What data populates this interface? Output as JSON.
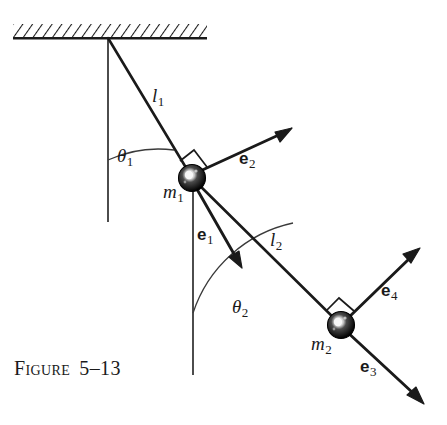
{
  "figure": {
    "caption_word": "Figure",
    "caption_number": "5–13",
    "caption_full": "Figure 5–13",
    "background_color": "#ffffff",
    "ink_color": "#1a1a1a"
  },
  "labels": {
    "l1": {
      "base": "l",
      "sub": "1"
    },
    "l2": {
      "base": "l",
      "sub": "2"
    },
    "m1": {
      "base": "m",
      "sub": "1"
    },
    "m2": {
      "base": "m",
      "sub": "2"
    },
    "theta1": {
      "base": "θ",
      "sub": "1"
    },
    "theta2": {
      "base": "θ",
      "sub": "2"
    },
    "e1": {
      "base": "e",
      "sub": "1"
    },
    "e2": {
      "base": "e",
      "sub": "2"
    },
    "e3": {
      "base": "e",
      "sub": "3"
    },
    "e4": {
      "base": "e",
      "sub": "4"
    }
  },
  "geometry": {
    "pivot": {
      "x": 108,
      "y": 38
    },
    "mass1_center": {
      "x": 192,
      "y": 178
    },
    "mass2_center": {
      "x": 341,
      "y": 325
    },
    "mass_radius": 13,
    "ceiling": {
      "x_left": 13,
      "x_right": 207,
      "y_line": 38,
      "hatch_height": 14
    },
    "vertical_ref_1": {
      "x": 108,
      "y_top": 38,
      "y_bottom": 222
    },
    "vertical_ref_2": {
      "x": 193,
      "y_top": 178,
      "y_bottom": 375
    },
    "rod_l1": {
      "x1": 108,
      "y1": 38,
      "x2": 192,
      "y2": 178
    },
    "rod_l2": {
      "x1": 192,
      "y1": 178,
      "x2": 341,
      "y2": 325
    },
    "arrow_e1": {
      "x1": 192,
      "y1": 178,
      "x2": 243,
      "y2": 268
    },
    "arrow_e2": {
      "x1": 192,
      "y1": 178,
      "x2": 292,
      "y2": 126
    },
    "arrow_e3": {
      "x1": 341,
      "y1": 325,
      "x2": 424,
      "y2": 404
    },
    "arrow_e4": {
      "x1": 341,
      "y1": 325,
      "x2": 420,
      "y2": 248
    },
    "right_angle_1": {
      "cx": 192,
      "cy": 178,
      "size": 20
    },
    "right_angle_2": {
      "cx": 341,
      "cy": 325,
      "size": 20
    },
    "angle_arc_1": {
      "vertex_x": 108,
      "vertex_y": 38,
      "radius": 122
    },
    "angle_arc_2": {
      "vertex_x": 193,
      "vertex_y": 178,
      "radius": 135
    }
  },
  "label_positions": {
    "l1": {
      "x": 152,
      "y": 86
    },
    "l2": {
      "x": 270,
      "y": 230
    },
    "m1": {
      "x": 163,
      "y": 182
    },
    "m2": {
      "x": 311,
      "y": 334
    },
    "theta1": {
      "x": 117,
      "y": 146
    },
    "theta2": {
      "x": 232,
      "y": 297
    },
    "e1": {
      "x": 197,
      "y": 226
    },
    "e2": {
      "x": 239,
      "y": 150
    },
    "e3": {
      "x": 360,
      "y": 358
    },
    "e4": {
      "x": 381,
      "y": 282
    }
  }
}
